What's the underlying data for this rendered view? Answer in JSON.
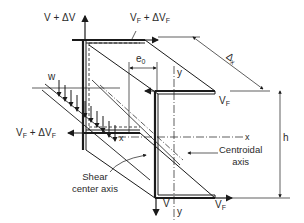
{
  "diagram": {
    "type": "shear-center beam element free body diagram",
    "labels": {
      "v_plus_dv": "V + ΔV",
      "vf_plus_dvf_top": {
        "base": "V",
        "sub": "F",
        "rest": " + ΔV",
        "sub2": "F"
      },
      "delta_x": {
        "base": "Δ",
        "sub": "x"
      },
      "e0": {
        "base": "e",
        "sub": "0"
      },
      "y_top": "y",
      "w": "w",
      "vf_right_top": {
        "base": "V",
        "sub": "F"
      },
      "vf_plus_dvf_left": {
        "base": "V",
        "sub": "F",
        "rest": " + ΔV",
        "sub2": "F"
      },
      "x_left": "x",
      "x_right": "x",
      "h": "h",
      "centroidal_axis": [
        "Centroidal",
        "axis"
      ],
      "shear_center_axis": [
        "Shear",
        "center axis"
      ],
      "v_bottom": "V",
      "vf_bottom": {
        "base": "V",
        "sub": "F"
      },
      "y_bottom": "y"
    },
    "colors": {
      "line": "#1a1a1a",
      "text": "#2a2a2a",
      "background": "#ffffff"
    }
  }
}
